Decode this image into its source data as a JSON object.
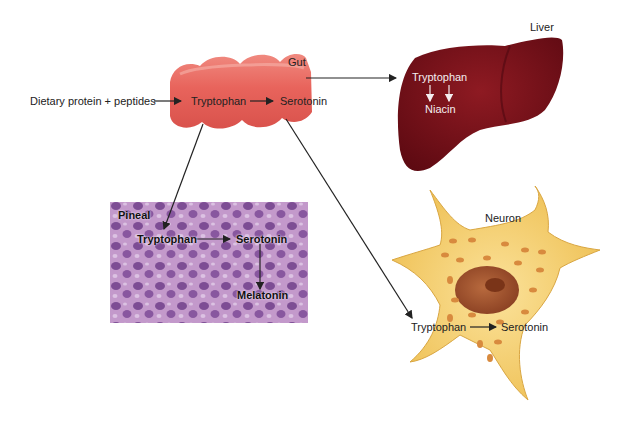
{
  "diagram": {
    "input": {
      "label": "Dietary protein + peptides"
    },
    "gut": {
      "name": "Gut",
      "nodes": [
        "Tryptophan",
        "Serotonin"
      ],
      "color": "#e8645c"
    },
    "liver": {
      "name": "Liver",
      "nodes": [
        "Tryptophan",
        "Niacin"
      ],
      "color": "#7a1018"
    },
    "pineal": {
      "name": "Pineal",
      "nodes": [
        "Tryptophan",
        "Serotonin",
        "Melatonin"
      ],
      "color": "#a86bb0"
    },
    "neuron": {
      "name": "Neuron",
      "nodes": [
        "Tryptophan",
        "Serotonin"
      ],
      "color": "#f2cd6a"
    },
    "edges": [
      {
        "from": "Dietary protein + peptides",
        "to": "Gut: Tryptophan"
      },
      {
        "from": "Gut: Tryptophan",
        "to": "Gut: Serotonin"
      },
      {
        "from": "Gut",
        "to": "Liver: Tryptophan"
      },
      {
        "from": "Liver: Tryptophan",
        "to": "Liver: Niacin"
      },
      {
        "from": "Gut",
        "to": "Pineal: Tryptophan"
      },
      {
        "from": "Pineal: Tryptophan",
        "to": "Pineal: Serotonin"
      },
      {
        "from": "Pineal: Serotonin",
        "to": "Pineal: Melatonin"
      },
      {
        "from": "Gut",
        "to": "Neuron: Tryptophan"
      },
      {
        "from": "Neuron: Tryptophan",
        "to": "Neuron: Serotonin"
      }
    ]
  }
}
